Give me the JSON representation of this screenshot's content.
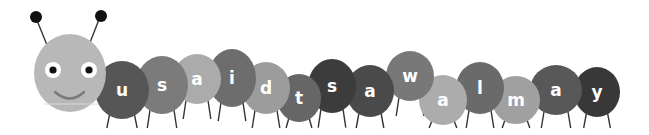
{
  "illustration": {
    "subject": "caterpillar",
    "sentence": "u said t saw a l m a y",
    "head": {
      "color": "#b8b8b8",
      "eye_white": "#ffffff",
      "pupil": "#111111",
      "smile": "#7a7a7a",
      "antenna_ball": "#111111"
    },
    "segments": [
      {
        "letter": "u",
        "cx": 122,
        "cy": 90,
        "rx": 27,
        "ry": 29,
        "color": "#565656"
      },
      {
        "letter": "s",
        "cx": 162,
        "cy": 85,
        "rx": 26,
        "ry": 29,
        "color": "#7b7b7b"
      },
      {
        "letter": "a",
        "cx": 197,
        "cy": 79,
        "rx": 24,
        "ry": 25,
        "color": "#ababab"
      },
      {
        "letter": "i",
        "cx": 232,
        "cy": 78,
        "rx": 24,
        "ry": 29,
        "color": "#6d6d6d"
      },
      {
        "letter": "d",
        "cx": 266,
        "cy": 88,
        "rx": 24,
        "ry": 26,
        "color": "#9c9c9c"
      },
      {
        "letter": "t",
        "cx": 299,
        "cy": 98,
        "rx": 22,
        "ry": 24,
        "color": "#666666"
      },
      {
        "letter": "s",
        "cx": 332,
        "cy": 86,
        "rx": 24,
        "ry": 27,
        "color": "#3c3c3c"
      },
      {
        "letter": "a",
        "cx": 370,
        "cy": 91,
        "rx": 24,
        "ry": 26,
        "color": "#4a4a4a"
      },
      {
        "letter": "w",
        "cx": 410,
        "cy": 76,
        "rx": 24,
        "ry": 25,
        "color": "#787878"
      },
      {
        "letter": "a",
        "cx": 443,
        "cy": 100,
        "rx": 24,
        "ry": 25,
        "color": "#acacac"
      },
      {
        "letter": "l",
        "cx": 480,
        "cy": 88,
        "rx": 24,
        "ry": 26,
        "color": "#6a6a6a"
      },
      {
        "letter": "m",
        "cx": 516,
        "cy": 100,
        "rx": 24,
        "ry": 24,
        "color": "#a0a0a0"
      },
      {
        "letter": "a",
        "cx": 556,
        "cy": 90,
        "rx": 26,
        "ry": 25,
        "color": "#585858"
      },
      {
        "letter": "y",
        "cx": 597,
        "cy": 92,
        "rx": 23,
        "ry": 25,
        "color": "#383838"
      }
    ]
  }
}
